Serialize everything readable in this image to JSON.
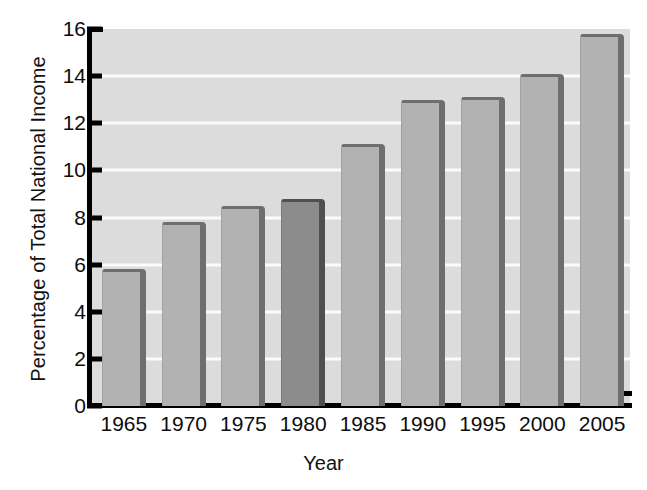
{
  "chart_data": {
    "type": "bar",
    "title": "",
    "xlabel": "Year",
    "ylabel": "Percentage of Total National Income",
    "categories": [
      "1965",
      "1970",
      "1975",
      "1980",
      "1985",
      "1990",
      "1995",
      "2000",
      "2005"
    ],
    "values": [
      5.8,
      7.8,
      8.5,
      8.8,
      11.1,
      13.0,
      13.1,
      14.1,
      15.8
    ],
    "ylim": [
      0,
      16
    ],
    "ytick_labels": [
      "0",
      "2",
      "4",
      "6",
      "8",
      "10",
      "12",
      "14",
      "16"
    ],
    "ytick_values": [
      0,
      2,
      4,
      6,
      8,
      10,
      12,
      14,
      16
    ],
    "grid": "horizontal",
    "legend": "none",
    "highlighted_category": "1980",
    "colors": {
      "plot_background": "#dcdcdc",
      "gridline": "#fbfbfb",
      "bar_face": "#b2b2b2",
      "bar_shadow": "#6e6e6e",
      "bar_highlight_face": "#8c8c8c",
      "bar_highlight_shadow": "#4f4f4f",
      "axis": "#000000",
      "text": "#0d0d0d",
      "figure_background": "#ffffff"
    }
  }
}
